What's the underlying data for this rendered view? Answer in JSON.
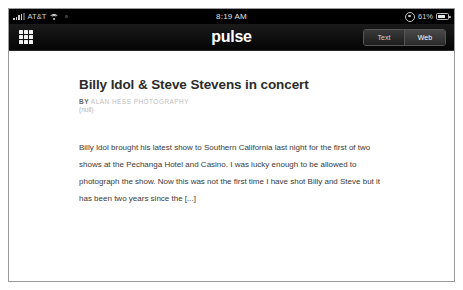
{
  "device": {
    "status_bar": {
      "carrier": "AT&T",
      "signal_icon": "signal-bars-icon",
      "wifi_icon": "wifi-icon",
      "clock": "8:19 AM",
      "rotation_lock_icon": "rotation-lock-icon",
      "battery_percent": "61%",
      "battery_icon": "battery-icon",
      "battery_level": 61
    }
  },
  "nav": {
    "grid_icon": "grid-menu-icon",
    "app_title": "pulse",
    "view_modes": [
      {
        "label": "Text",
        "active": false
      },
      {
        "label": "Web",
        "active": true
      }
    ]
  },
  "article": {
    "title": "Billy Idol & Steve Stevens in concert",
    "byline_prefix": "BY",
    "byline_source": "ALAN HESS PHOTOGRAPHY",
    "byline_meta": "(null)",
    "body": "Billy Idol brought his latest show to Southern California last night for the first of two shows at the Pechanga Hotel and Casino. I was lucky enough to be allowed to photograph the show. Now this was not the first time I have shot Billy and Steve but it has been two years since the [...]"
  },
  "colors": {
    "chrome_background": "#0a0a0a",
    "status_background": "#000000",
    "page_background": "#ffffff",
    "title_text": "#2b2b2b",
    "body_text": "#3a3a3a",
    "byline_muted": "#c0c0c0",
    "frame_border": "#9a9a9a"
  }
}
